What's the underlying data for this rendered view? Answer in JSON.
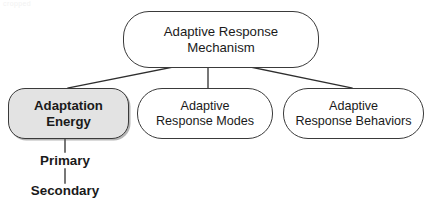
{
  "diagram": {
    "type": "hierarchy-tree",
    "title": "Adaptive Response Mechanism",
    "colors": {
      "background": "#ffffff",
      "node_stroke": "#3a3a3a",
      "node_fill": "#ffffff",
      "highlight_fill": "#e3e3e3",
      "text": "#1a1a1a",
      "connector": "#2e2e2e"
    },
    "artifact": {
      "text": "cropped",
      "note": "faint clipped text at top-left edge"
    },
    "root": {
      "id": "adaptive-response-mechanism",
      "label": "Adaptive Response\nMechanism",
      "line1": "Adaptive Response",
      "line2": "Mechanism",
      "highlighted": false
    },
    "children": [
      {
        "id": "adaptation-energy",
        "label": "Adaptation\nEnergy",
        "line1": "Adaptation",
        "line2": "Energy",
        "highlighted": true,
        "bold": true
      },
      {
        "id": "adaptive-response-modes",
        "label": "Adaptive\nResponse Modes",
        "line1": "Adaptive",
        "line2": "Response Modes",
        "highlighted": false,
        "bold": false
      },
      {
        "id": "adaptive-response-behaviors",
        "label": "Adaptive\nResponse Behaviors",
        "line1": "Adaptive",
        "line2": "Response Behaviors",
        "highlighted": false,
        "bold": false
      }
    ],
    "leaves": [
      {
        "id": "primary",
        "label": "Primary",
        "parent": "adaptation-energy"
      },
      {
        "id": "secondary",
        "label": "Secondary",
        "parent": "primary"
      }
    ],
    "connectors": [
      {
        "from": "adaptive-response-mechanism",
        "to": "adaptation-energy",
        "style": "diagonal"
      },
      {
        "from": "adaptive-response-mechanism",
        "to": "adaptive-response-modes",
        "style": "vertical"
      },
      {
        "from": "adaptive-response-mechanism",
        "to": "adaptive-response-behaviors",
        "style": "diagonal"
      },
      {
        "from": "adaptation-energy",
        "to": "primary",
        "style": "vertical"
      },
      {
        "from": "primary",
        "to": "secondary",
        "style": "vertical"
      }
    ]
  }
}
